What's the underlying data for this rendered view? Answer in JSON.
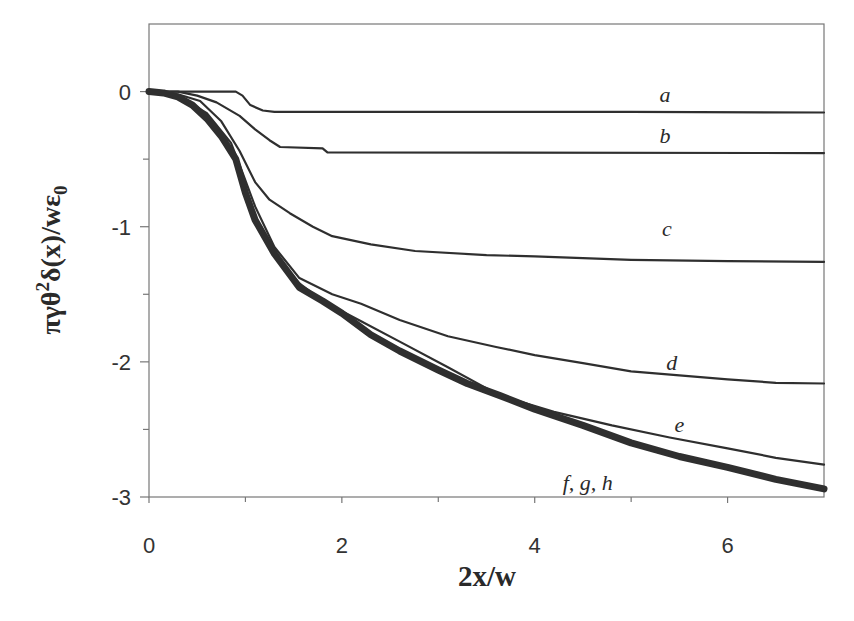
{
  "chart_data": {
    "type": "line",
    "title": "",
    "xlabel": "2x/w",
    "ylabel": "πγθ²δ(x)/wε₀",
    "ylabel_parts": {
      "pre": "πγθ",
      "sup": "2",
      "mid": "δ(x)/wε",
      "sub": "0"
    },
    "xlim": [
      0,
      7
    ],
    "ylim": [
      -3,
      0.5
    ],
    "x_ticks": [
      0,
      2,
      4,
      6
    ],
    "x_tick_labels": [
      "0",
      "2",
      "4",
      "6"
    ],
    "x_minor_ticks": [
      1,
      3,
      5
    ],
    "y_ticks": [
      0,
      -1,
      -2,
      -3
    ],
    "y_tick_labels": [
      "0",
      "-1",
      "-2",
      "-3"
    ],
    "y_minor_ticks": [
      -0.5,
      -1.5,
      -2.5
    ],
    "grid": false,
    "legend": "inline labels",
    "series": [
      {
        "name": "a",
        "label_pos": [
          5.35,
          -0.08
        ],
        "width": 2.2,
        "points": [
          [
            0,
            0
          ],
          [
            0.9,
            0
          ],
          [
            0.97,
            -0.03
          ],
          [
            1.05,
            -0.1
          ],
          [
            1.18,
            -0.14
          ],
          [
            1.3,
            -0.15
          ],
          [
            5,
            -0.15
          ],
          [
            7,
            -0.155
          ]
        ]
      },
      {
        "name": "b",
        "label_pos": [
          5.35,
          -0.38
        ],
        "width": 2.2,
        "points": [
          [
            0,
            0
          ],
          [
            0.3,
            0
          ],
          [
            0.5,
            -0.03
          ],
          [
            0.7,
            -0.08
          ],
          [
            0.94,
            -0.18
          ],
          [
            1.1,
            -0.28
          ],
          [
            1.25,
            -0.36
          ],
          [
            1.36,
            -0.41
          ],
          [
            1.8,
            -0.42
          ],
          [
            1.85,
            -0.45
          ],
          [
            7,
            -0.455
          ]
        ]
      },
      {
        "name": "c",
        "label_pos": [
          5.37,
          -1.07
        ],
        "width": 2.2,
        "points": [
          [
            0,
            0
          ],
          [
            0.3,
            -0.02
          ],
          [
            0.53,
            -0.07
          ],
          [
            0.75,
            -0.22
          ],
          [
            0.94,
            -0.44
          ],
          [
            1.1,
            -0.67
          ],
          [
            1.25,
            -0.8
          ],
          [
            1.46,
            -0.9
          ],
          [
            1.7,
            -1.0
          ],
          [
            1.9,
            -1.07
          ],
          [
            2.3,
            -1.13
          ],
          [
            2.76,
            -1.18
          ],
          [
            3.5,
            -1.21
          ],
          [
            4.0,
            -1.22
          ],
          [
            5.0,
            -1.245
          ],
          [
            6.0,
            -1.255
          ],
          [
            7,
            -1.26
          ]
        ]
      },
      {
        "name": "d",
        "label_pos": [
          5.42,
          -2.06
        ],
        "width": 2.2,
        "points": [
          [
            0,
            0
          ],
          [
            0.3,
            -0.03
          ],
          [
            0.6,
            -0.16
          ],
          [
            0.85,
            -0.38
          ],
          [
            0.97,
            -0.6
          ],
          [
            1.1,
            -0.85
          ],
          [
            1.3,
            -1.15
          ],
          [
            1.56,
            -1.38
          ],
          [
            1.9,
            -1.5
          ],
          [
            2.2,
            -1.57
          ],
          [
            2.6,
            -1.69
          ],
          [
            3.1,
            -1.81
          ],
          [
            3.6,
            -1.89
          ],
          [
            4.0,
            -1.95
          ],
          [
            4.5,
            -2.01
          ],
          [
            5.0,
            -2.07
          ],
          [
            5.5,
            -2.1
          ],
          [
            6.0,
            -2.13
          ],
          [
            6.5,
            -2.155
          ],
          [
            7,
            -2.16
          ]
        ]
      },
      {
        "name": "e",
        "label_pos": [
          5.5,
          -2.52
        ],
        "width": 2.2,
        "points": [
          [
            0,
            0
          ],
          [
            0.3,
            -0.03
          ],
          [
            0.6,
            -0.18
          ],
          [
            0.85,
            -0.42
          ],
          [
            0.97,
            -0.65
          ],
          [
            1.05,
            -0.88
          ],
          [
            1.3,
            -1.2
          ],
          [
            1.56,
            -1.42
          ],
          [
            1.8,
            -1.55
          ],
          [
            2.2,
            -1.7
          ],
          [
            2.6,
            -1.85
          ],
          [
            3.1,
            -2.04
          ],
          [
            3.64,
            -2.25
          ],
          [
            4.2,
            -2.37
          ],
          [
            4.8,
            -2.47
          ],
          [
            5.4,
            -2.56
          ],
          [
            6.0,
            -2.64
          ],
          [
            6.5,
            -2.71
          ],
          [
            7,
            -2.76
          ]
        ]
      },
      {
        "name": "f, g, h",
        "label_pos": [
          4.55,
          -2.95
        ],
        "width": 7,
        "points": [
          [
            0,
            0
          ],
          [
            0.15,
            -0.01
          ],
          [
            0.3,
            -0.04
          ],
          [
            0.45,
            -0.1
          ],
          [
            0.6,
            -0.2
          ],
          [
            0.75,
            -0.33
          ],
          [
            0.9,
            -0.5
          ],
          [
            1.0,
            -0.75
          ],
          [
            1.1,
            -0.95
          ],
          [
            1.3,
            -1.2
          ],
          [
            1.56,
            -1.45
          ],
          [
            1.8,
            -1.55
          ],
          [
            2.0,
            -1.64
          ],
          [
            2.3,
            -1.8
          ],
          [
            2.6,
            -1.92
          ],
          [
            3.0,
            -2.06
          ],
          [
            3.3,
            -2.16
          ],
          [
            3.64,
            -2.25
          ],
          [
            4.0,
            -2.35
          ],
          [
            4.5,
            -2.47
          ],
          [
            5.0,
            -2.6
          ],
          [
            5.5,
            -2.7
          ],
          [
            6.0,
            -2.78
          ],
          [
            6.5,
            -2.87
          ],
          [
            7,
            -2.94
          ]
        ]
      }
    ]
  }
}
